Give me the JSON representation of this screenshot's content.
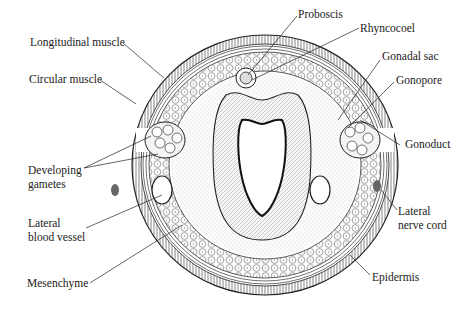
{
  "diagram": {
    "labels": {
      "proboscis": "Proboscis",
      "rhyncocoel": "Rhyncocoel",
      "longitudinal_muscle": "Longitudinal muscle",
      "circular_muscle": "Circular muscle",
      "gonadal_sac": "Gonadal sac",
      "gonopore": "Gonopore",
      "gonoduct": "Gonoduct",
      "developing_gametes_1": "Developing",
      "developing_gametes_2": "gametes",
      "lateral_blood_vessel_1": "Lateral",
      "lateral_blood_vessel_2": "blood vessel",
      "lateral_nerve_cord_1": "Lateral",
      "lateral_nerve_cord_2": "nerve cord",
      "mesenchyme": "Mesenchyme",
      "epidermis": "Epidermis"
    },
    "colors": {
      "ink": "#1a1a1a",
      "background": "#ffffff",
      "tissue_fill": "#f4f4f4"
    }
  }
}
